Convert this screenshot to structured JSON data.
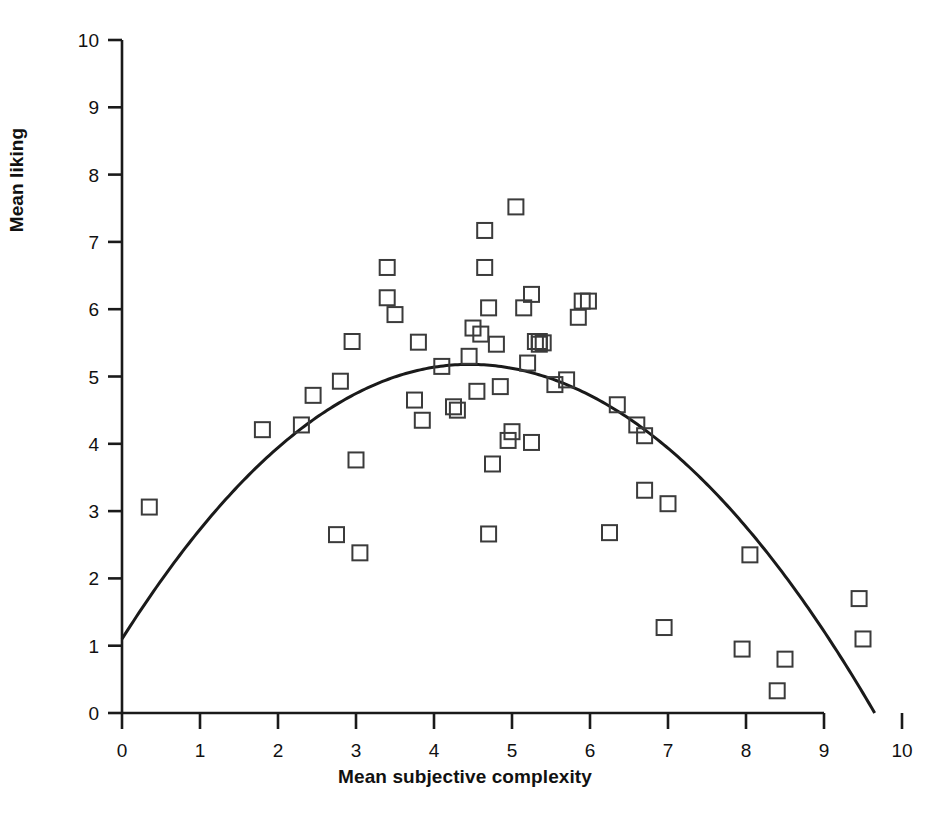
{
  "figure": {
    "background_color": "#ffffff",
    "line_color": "#1a1a1a",
    "marker_edge_color": "#3b3b3b",
    "marker_fill": "none"
  },
  "axes": {
    "x_title": "Mean subjective complexity",
    "y_title": "Mean liking",
    "x_ticks": [
      "0",
      "1",
      "2",
      "3",
      "4",
      "5",
      "6",
      "7",
      "8",
      "9",
      "10"
    ],
    "y_ticks": [
      "0",
      "1",
      "2",
      "3",
      "4",
      "5",
      "6",
      "7",
      "8",
      "9",
      "10"
    ]
  },
  "caption": {
    "text": ""
  },
  "chart_data": {
    "type": "scatter",
    "title": "",
    "xlabel": "Mean subjective complexity",
    "ylabel": "Mean liking",
    "xlim": [
      0,
      10
    ],
    "ylim": [
      0,
      10
    ],
    "grid": false,
    "legend": "none",
    "marker": "open-square",
    "series": [
      {
        "name": "Stimuli",
        "points": [
          [
            0.35,
            3.06
          ],
          [
            1.8,
            4.21
          ],
          [
            2.3,
            4.28
          ],
          [
            2.45,
            4.72
          ],
          [
            2.75,
            2.65
          ],
          [
            2.8,
            4.93
          ],
          [
            2.95,
            5.52
          ],
          [
            3.0,
            3.76
          ],
          [
            3.05,
            2.38
          ],
          [
            3.4,
            6.62
          ],
          [
            3.4,
            6.17
          ],
          [
            3.5,
            5.92
          ],
          [
            3.75,
            4.65
          ],
          [
            3.8,
            5.51
          ],
          [
            3.85,
            4.35
          ],
          [
            4.1,
            5.15
          ],
          [
            4.25,
            4.55
          ],
          [
            4.3,
            4.5
          ],
          [
            4.45,
            5.3
          ],
          [
            4.5,
            5.72
          ],
          [
            4.55,
            4.78
          ],
          [
            4.6,
            5.63
          ],
          [
            4.65,
            7.17
          ],
          [
            4.65,
            6.62
          ],
          [
            4.7,
            2.66
          ],
          [
            4.7,
            6.02
          ],
          [
            4.75,
            3.7
          ],
          [
            4.8,
            5.48
          ],
          [
            4.85,
            4.85
          ],
          [
            4.95,
            4.05
          ],
          [
            5.0,
            4.18
          ],
          [
            5.05,
            7.52
          ],
          [
            5.15,
            6.02
          ],
          [
            5.2,
            5.2
          ],
          [
            5.25,
            6.22
          ],
          [
            5.25,
            4.02
          ],
          [
            5.3,
            5.52
          ],
          [
            5.35,
            5.52
          ],
          [
            5.35,
            5.48
          ],
          [
            5.4,
            5.5
          ],
          [
            5.55,
            4.88
          ],
          [
            5.7,
            4.95
          ],
          [
            5.85,
            5.88
          ],
          [
            5.9,
            6.12
          ],
          [
            5.98,
            6.12
          ],
          [
            6.25,
            2.68
          ],
          [
            6.35,
            4.58
          ],
          [
            6.6,
            4.28
          ],
          [
            6.7,
            4.12
          ],
          [
            6.7,
            3.31
          ],
          [
            6.95,
            1.27
          ],
          [
            7.0,
            3.11
          ],
          [
            7.95,
            0.95
          ],
          [
            8.05,
            2.35
          ],
          [
            8.4,
            0.33
          ],
          [
            8.5,
            0.8
          ],
          [
            9.45,
            1.7
          ],
          [
            9.5,
            1.1
          ]
        ]
      }
    ],
    "fit_curve": {
      "name": "Inverted-U quadratic fit",
      "shape": "quadratic",
      "x_start": 0.0,
      "x_end": 9.65,
      "y_at_x_start": 1.1,
      "vertex_x": 4.45,
      "vertex_y": 5.18,
      "y_at_x_end": 0.0
    }
  }
}
